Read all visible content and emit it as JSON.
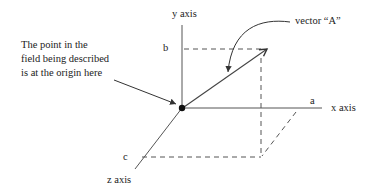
{
  "diagram": {
    "type": "3d-vector-components",
    "labels": {
      "y_axis": "y axis",
      "x_axis": "x axis",
      "z_axis": "z axis",
      "a": "a",
      "b": "b",
      "c": "c",
      "vector": "vector “A”"
    },
    "annotation": {
      "line1": "The point in the",
      "line2": "field being described",
      "line3": "is at the origin here"
    },
    "colors": {
      "line": "#444444",
      "text": "#222222",
      "dot": "#111111"
    }
  }
}
